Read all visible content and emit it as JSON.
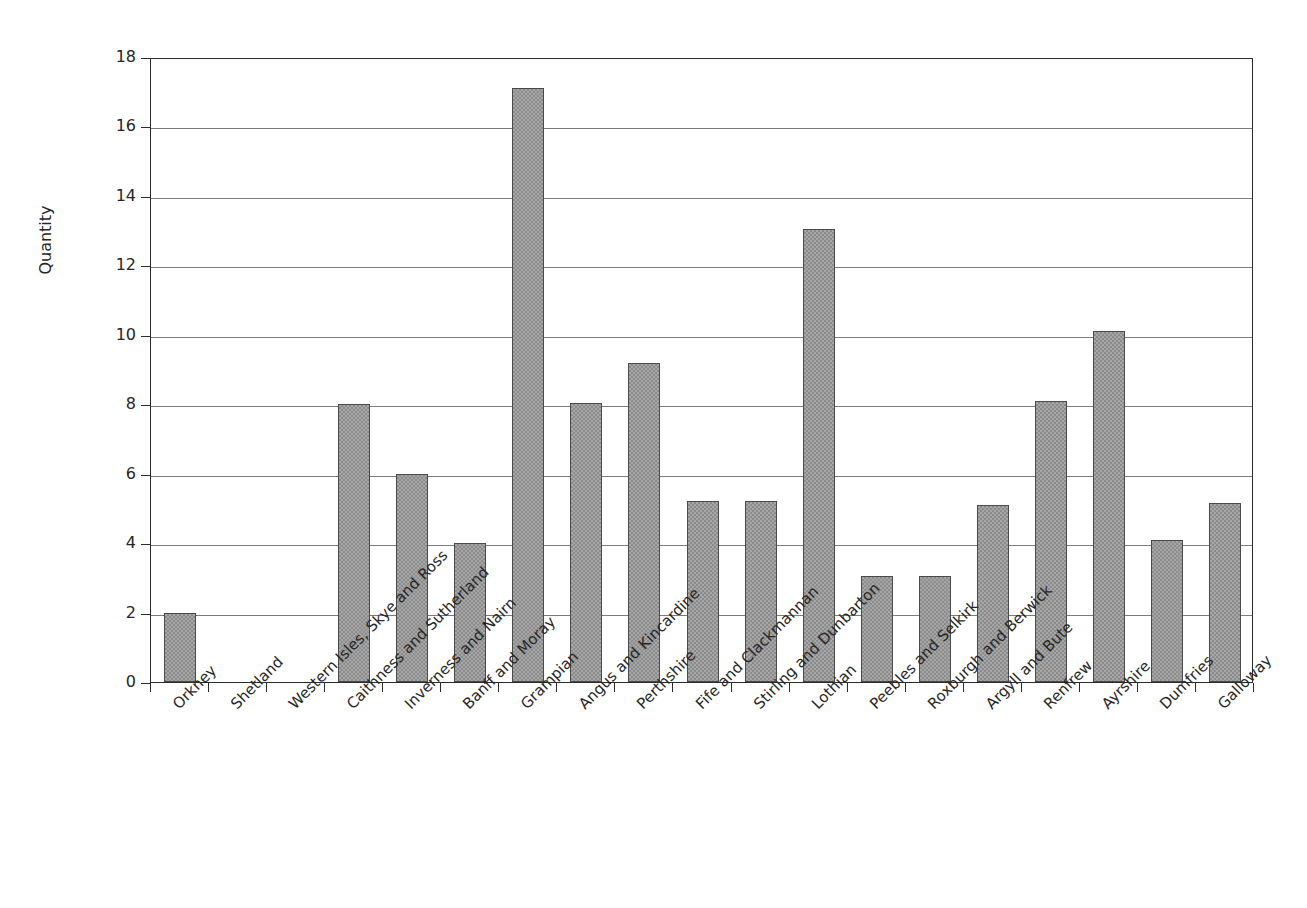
{
  "chart_data": {
    "type": "bar",
    "title": "",
    "xlabel": "",
    "ylabel": "Quantity",
    "ylim": [
      0,
      18
    ],
    "ytick_step": 2,
    "yticks": [
      0,
      2,
      4,
      6,
      8,
      10,
      12,
      14,
      16,
      18
    ],
    "grid": true,
    "legend": "none",
    "categories": [
      "Orkney",
      "Shetland",
      "Western Isles, Skye and Ross",
      "Caithness and Sutherland",
      "Inverness and Nairn",
      "Banff and Moray",
      "Grampian",
      "Angus and Kincardine",
      "Perthshire",
      "Fife and Clackmannan",
      "Stirling and Dunbarton",
      "Lothian",
      "Peebles and Selkirk",
      "Roxburgh and Berwick",
      "Argyll and Bute",
      "Renfrew",
      "Ayrshire",
      "Dumfries",
      "Galloway"
    ],
    "values": [
      2,
      0,
      0,
      8,
      6,
      4,
      17.1,
      8.05,
      9.2,
      5.2,
      5.2,
      13.05,
      3.05,
      3.05,
      5.1,
      8.1,
      10.1,
      4.1,
      5.15
    ],
    "bar_color": "#a6a6a6",
    "bar_border_color": "#4a4a4a",
    "gridline_color": "#7b7b7b",
    "axis_color": "#2b2b2b"
  },
  "axes": {
    "y_title": "Quantity"
  }
}
